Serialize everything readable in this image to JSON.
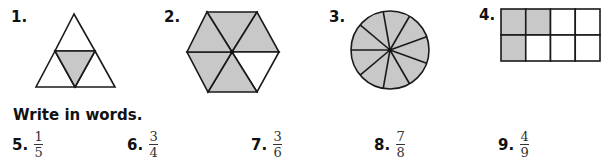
{
  "figures": [
    {
      "number": "1.",
      "shape": "triangle",
      "parts": 4,
      "shaded_parts": 1
    },
    {
      "number": "2.",
      "shape": "hexagon",
      "parts": 6,
      "shaded_parts": 5
    },
    {
      "number": "3.",
      "shape": "circle",
      "parts": 9,
      "shaded_parts": 9
    },
    {
      "number": "4.",
      "shape": "rectangle-grid",
      "rows": 2,
      "cols": 4,
      "parts": 8,
      "shaded_parts": 3
    }
  ],
  "colors": {
    "shade": "#c8c8c8",
    "stroke": "#1a1a1a"
  },
  "instruction": "Write in words.",
  "exercises": [
    {
      "number": "5.",
      "numerator": "1",
      "denominator": "5"
    },
    {
      "number": "6.",
      "numerator": "3",
      "denominator": "4"
    },
    {
      "number": "7.",
      "numerator": "3",
      "denominator": "6"
    },
    {
      "number": "8.",
      "numerator": "7",
      "denominator": "8"
    },
    {
      "number": "9.",
      "numerator": "4",
      "denominator": "9"
    }
  ]
}
